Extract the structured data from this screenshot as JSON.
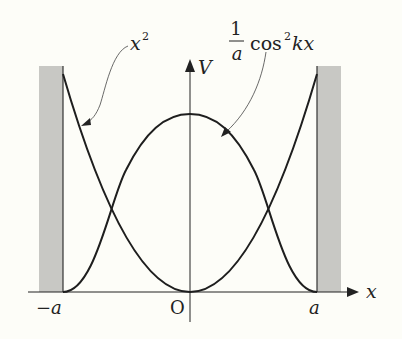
{
  "diagram": {
    "axes": {
      "x_label": "x",
      "y_label": "V",
      "origin_label": "O",
      "left_tick": "−a",
      "right_tick": "a"
    },
    "curves": [
      {
        "name": "parabola",
        "label": "x",
        "label_exponent": "2",
        "formula": "x^2"
      },
      {
        "name": "cosine-squared",
        "label_num": "1",
        "label_den": "a",
        "label_func": "cos",
        "label_exponent": "2",
        "label_arg": "kx",
        "formula": "(1/a)cos^2(kx)"
      }
    ],
    "colors": {
      "background": "#fdfdf8",
      "wall": "#c8c8c4",
      "line": "#1e1e1e"
    }
  }
}
